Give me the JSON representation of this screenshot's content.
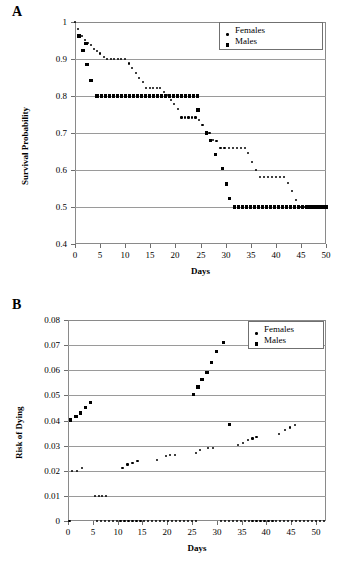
{
  "figure": {
    "panels": [
      {
        "letter": "A",
        "legend": [
          {
            "label": "Females",
            "marker": "dot"
          },
          {
            "label": "Males",
            "marker": "square"
          }
        ]
      },
      {
        "letter": "B",
        "legend": [
          {
            "label": "Females",
            "marker": "dot"
          },
          {
            "label": "Males",
            "marker": "square"
          }
        ]
      }
    ]
  },
  "chart_data": [
    {
      "type": "scatter",
      "title": "",
      "panel": "A",
      "xlabel": "Days",
      "ylabel": "Survival Probability",
      "xlim": [
        0,
        50
      ],
      "ylim": [
        0.4,
        1.0
      ],
      "xticks": [
        0,
        5,
        10,
        15,
        20,
        25,
        30,
        35,
        40,
        45,
        50
      ],
      "yticks": [
        0.4,
        0.5,
        0.6,
        0.7,
        0.8,
        0.9,
        1
      ],
      "ytick_labels": [
        "0.4",
        "0.5",
        "0.6",
        "0.7",
        "0.8",
        "0.9",
        "1"
      ],
      "grid": "horizontal",
      "legend_position": "top-right",
      "series": [
        {
          "name": "Females",
          "marker": "dot",
          "points": [
            [
              0,
              1.0
            ],
            [
              0.6,
              0.98
            ],
            [
              1.0,
              0.965
            ],
            [
              1.4,
              0.962
            ],
            [
              2.0,
              0.952
            ],
            [
              2.6,
              0.943
            ],
            [
              3.2,
              0.937
            ],
            [
              3.8,
              0.928
            ],
            [
              4.4,
              0.921
            ],
            [
              5.0,
              0.915
            ],
            [
              5.7,
              0.906
            ],
            [
              6.4,
              0.9
            ],
            [
              7.1,
              0.9
            ],
            [
              7.8,
              0.9
            ],
            [
              8.5,
              0.9
            ],
            [
              9.2,
              0.9
            ],
            [
              10.0,
              0.9
            ],
            [
              10.7,
              0.888
            ],
            [
              11.4,
              0.875
            ],
            [
              12.1,
              0.862
            ],
            [
              12.8,
              0.848
            ],
            [
              13.5,
              0.838
            ],
            [
              14.2,
              0.822
            ],
            [
              14.9,
              0.822
            ],
            [
              15.6,
              0.822
            ],
            [
              16.3,
              0.822
            ],
            [
              17.0,
              0.822
            ],
            [
              17.7,
              0.81
            ],
            [
              18.4,
              0.802
            ],
            [
              19.1,
              0.79
            ],
            [
              19.8,
              0.778
            ],
            [
              20.5,
              0.764
            ],
            [
              21.2,
              0.742
            ],
            [
              21.9,
              0.742
            ],
            [
              22.6,
              0.742
            ],
            [
              23.3,
              0.742
            ],
            [
              24.0,
              0.742
            ],
            [
              24.7,
              0.735
            ],
            [
              25.4,
              0.722
            ],
            [
              26.1,
              0.7
            ],
            [
              26.8,
              0.7
            ],
            [
              27.5,
              0.682
            ],
            [
              28.2,
              0.678
            ],
            [
              29.0,
              0.66
            ],
            [
              29.8,
              0.66
            ],
            [
              30.6,
              0.66
            ],
            [
              31.4,
              0.66
            ],
            [
              32.2,
              0.66
            ],
            [
              33.0,
              0.66
            ],
            [
              33.8,
              0.66
            ],
            [
              34.5,
              0.645
            ],
            [
              35.2,
              0.622
            ],
            [
              36.0,
              0.6
            ],
            [
              36.8,
              0.58
            ],
            [
              37.6,
              0.58
            ],
            [
              38.4,
              0.58
            ],
            [
              39.2,
              0.58
            ],
            [
              40.0,
              0.58
            ],
            [
              40.8,
              0.58
            ],
            [
              41.6,
              0.58
            ],
            [
              42.4,
              0.565
            ],
            [
              43.2,
              0.543
            ],
            [
              44.0,
              0.52
            ],
            [
              44.8,
              0.5
            ],
            [
              45.6,
              0.5
            ],
            [
              46.4,
              0.5
            ],
            [
              47.2,
              0.5
            ],
            [
              48.0,
              0.5
            ],
            [
              48.8,
              0.5
            ],
            [
              49.6,
              0.5
            ],
            [
              50.0,
              0.5
            ]
          ]
        },
        {
          "name": "Males",
          "marker": "square",
          "points": [
            [
              0.8,
              0.962
            ],
            [
              1.6,
              0.922
            ],
            [
              2.2,
              0.942
            ],
            [
              2.4,
              0.886
            ],
            [
              3.2,
              0.842
            ],
            [
              4.4,
              0.8
            ],
            [
              5.2,
              0.8
            ],
            [
              6.0,
              0.8
            ],
            [
              6.8,
              0.8
            ],
            [
              7.6,
              0.8
            ],
            [
              8.4,
              0.8
            ],
            [
              9.2,
              0.8
            ],
            [
              10.0,
              0.8
            ],
            [
              10.8,
              0.8
            ],
            [
              11.6,
              0.8
            ],
            [
              12.4,
              0.8
            ],
            [
              13.2,
              0.8
            ],
            [
              14.0,
              0.8
            ],
            [
              14.8,
              0.8
            ],
            [
              15.6,
              0.8
            ],
            [
              16.4,
              0.8
            ],
            [
              17.2,
              0.8
            ],
            [
              18.0,
              0.8
            ],
            [
              18.8,
              0.8
            ],
            [
              19.6,
              0.8
            ],
            [
              20.4,
              0.8
            ],
            [
              21.2,
              0.8
            ],
            [
              22.0,
              0.8
            ],
            [
              22.8,
              0.8
            ],
            [
              23.6,
              0.8
            ],
            [
              24.4,
              0.8
            ],
            [
              24.5,
              0.762
            ],
            [
              26.2,
              0.7
            ],
            [
              27.0,
              0.68
            ],
            [
              28.0,
              0.642
            ],
            [
              29.4,
              0.603
            ],
            [
              30.2,
              0.562
            ],
            [
              30.8,
              0.522
            ],
            [
              31.8,
              0.5
            ],
            [
              32.6,
              0.5
            ],
            [
              33.4,
              0.5
            ],
            [
              34.2,
              0.5
            ],
            [
              35.0,
              0.5
            ],
            [
              35.8,
              0.5
            ],
            [
              36.6,
              0.5
            ],
            [
              37.4,
              0.5
            ],
            [
              38.2,
              0.5
            ],
            [
              39.0,
              0.5
            ],
            [
              39.8,
              0.5
            ],
            [
              40.6,
              0.5
            ],
            [
              41.4,
              0.5
            ],
            [
              42.2,
              0.5
            ],
            [
              43.0,
              0.5
            ],
            [
              43.8,
              0.5
            ],
            [
              44.6,
              0.5
            ],
            [
              45.4,
              0.5
            ],
            [
              46.2,
              0.5
            ],
            [
              47.0,
              0.5
            ],
            [
              47.8,
              0.5
            ],
            [
              48.6,
              0.5
            ],
            [
              49.4,
              0.5
            ],
            [
              50.0,
              0.5
            ]
          ]
        }
      ]
    },
    {
      "type": "scatter",
      "title": "",
      "panel": "B",
      "xlabel": "Days",
      "ylabel": "Risk of Dying",
      "xlim": [
        0,
        52
      ],
      "ylim": [
        0,
        0.08
      ],
      "xticks": [
        0,
        5,
        10,
        15,
        20,
        25,
        30,
        35,
        40,
        45,
        50
      ],
      "yticks": [
        0,
        0.01,
        0.02,
        0.03,
        0.04,
        0.05,
        0.06,
        0.07,
        0.08
      ],
      "ytick_labels": [
        "0",
        "0.01",
        "0.02",
        "0.03",
        "0.04",
        "0.05",
        "0.06",
        "0.07",
        "0.08"
      ],
      "grid": "horizontal",
      "legend_position": "top-right",
      "series": [
        {
          "name": "Females",
          "marker": "dot",
          "points": [
            [
              0.3,
              0.0
            ],
            [
              0.8,
              0.02
            ],
            [
              1.8,
              0.02
            ],
            [
              2.8,
              0.021
            ],
            [
              5.5,
              0.01
            ],
            [
              6.2,
              0.01
            ],
            [
              6.9,
              0.01
            ],
            [
              7.6,
              0.01
            ],
            [
              11.0,
              0.021
            ],
            [
              12.0,
              0.0225
            ],
            [
              13.0,
              0.0232
            ],
            [
              14.0,
              0.024
            ],
            [
              18.0,
              0.0242
            ],
            [
              19.8,
              0.0258
            ],
            [
              20.6,
              0.0262
            ],
            [
              21.5,
              0.0262
            ],
            [
              25.8,
              0.0272
            ],
            [
              26.6,
              0.0281
            ],
            [
              28.3,
              0.0292
            ],
            [
              29.2,
              0.0292
            ],
            [
              34.3,
              0.0303
            ],
            [
              35.2,
              0.0312
            ],
            [
              36.2,
              0.0322
            ],
            [
              37.2,
              0.0328
            ],
            [
              38.0,
              0.0333
            ],
            [
              42.5,
              0.0345
            ],
            [
              43.8,
              0.0363
            ],
            [
              44.7,
              0.0372
            ],
            [
              45.8,
              0.0383
            ],
            [
              5.8,
              0.0
            ],
            [
              6.6,
              0.0
            ],
            [
              7.4,
              0.0
            ],
            [
              8.2,
              0.0
            ],
            [
              9.0,
              0.0
            ],
            [
              9.8,
              0.0
            ],
            [
              10.6,
              0.0
            ],
            [
              11.4,
              0.0
            ],
            [
              12.2,
              0.0
            ],
            [
              13.0,
              0.0
            ],
            [
              13.8,
              0.0
            ],
            [
              14.6,
              0.0
            ],
            [
              15.4,
              0.0
            ],
            [
              16.2,
              0.0
            ],
            [
              17.0,
              0.0
            ],
            [
              17.8,
              0.0
            ],
            [
              18.6,
              0.0
            ],
            [
              19.4,
              0.0
            ],
            [
              20.2,
              0.0
            ],
            [
              21.0,
              0.0
            ],
            [
              21.8,
              0.0
            ],
            [
              22.6,
              0.0
            ],
            [
              23.4,
              0.0
            ],
            [
              24.2,
              0.0
            ],
            [
              25.0,
              0.0
            ],
            [
              25.8,
              0.0
            ],
            [
              30.8,
              0.0
            ],
            [
              31.6,
              0.0
            ],
            [
              32.4,
              0.0
            ],
            [
              33.2,
              0.0
            ],
            [
              34.0,
              0.0
            ],
            [
              34.8,
              0.0
            ],
            [
              35.6,
              0.0
            ],
            [
              36.4,
              0.0
            ],
            [
              37.2,
              0.0
            ],
            [
              38.0,
              0.0
            ],
            [
              38.8,
              0.0
            ],
            [
              39.6,
              0.0
            ],
            [
              40.4,
              0.0
            ],
            [
              41.2,
              0.0
            ],
            [
              42.0,
              0.0
            ],
            [
              42.8,
              0.0
            ],
            [
              43.6,
              0.0
            ],
            [
              44.4,
              0.0
            ],
            [
              45.2,
              0.0
            ],
            [
              46.0,
              0.0
            ],
            [
              46.8,
              0.0
            ],
            [
              47.6,
              0.0
            ],
            [
              48.4,
              0.0
            ],
            [
              49.2,
              0.0
            ],
            [
              50.0,
              0.0
            ],
            [
              50.8,
              0.0
            ],
            [
              51.6,
              0.0
            ]
          ]
        },
        {
          "name": "Males",
          "marker": "square",
          "points": [
            [
              0.5,
              0.0402
            ],
            [
              1.6,
              0.0417
            ],
            [
              2.6,
              0.043
            ],
            [
              3.6,
              0.0452
            ],
            [
              4.6,
              0.0473
            ],
            [
              25.3,
              0.0503
            ],
            [
              26.2,
              0.0533
            ],
            [
              27.0,
              0.0562
            ],
            [
              28.0,
              0.059
            ],
            [
              29.0,
              0.0632
            ],
            [
              30.0,
              0.0673
            ],
            [
              31.3,
              0.0712
            ],
            [
              32.5,
              0.0385
            ]
          ]
        }
      ]
    }
  ]
}
